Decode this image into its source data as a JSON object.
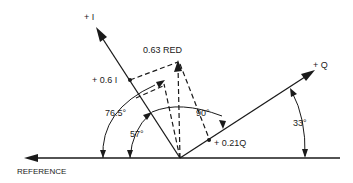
{
  "diagram": {
    "axes": {
      "plus_i": "+ I",
      "plus_q": "+ Q",
      "reference": "REFERENCE"
    },
    "vector": {
      "label": "0.63 RED"
    },
    "components": {
      "i_component": "+ 0.6 I",
      "q_component": "+ 0.21Q"
    },
    "angles": {
      "red_from_reference": "76.5°",
      "i_from_reference": "57°",
      "i_to_q": "90°",
      "q_from_reference": "33°"
    }
  }
}
